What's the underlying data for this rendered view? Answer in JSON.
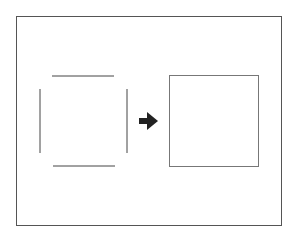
{
  "diagram": {
    "colors": {
      "background": "#ffffff",
      "frame": "#555555",
      "segments": "#444444",
      "arrow": "#222222",
      "square": "#777777"
    },
    "frame": {
      "x": 16,
      "y": 16,
      "width": 265,
      "height": 209
    },
    "open_square": {
      "top": {
        "x1": 52,
        "y1": 76,
        "x2": 114,
        "y2": 76
      },
      "bottom": {
        "x1": 53,
        "y1": 166,
        "x2": 115,
        "y2": 166
      },
      "left": {
        "x1": 40,
        "y1": 89,
        "x2": 40,
        "y2": 153
      },
      "right": {
        "x1": 127,
        "y1": 89,
        "x2": 127,
        "y2": 153
      }
    },
    "arrow": {
      "direction": "right",
      "x": 139,
      "y": 112,
      "width": 19,
      "height": 18
    },
    "closed_square": {
      "x": 169,
      "y": 75,
      "width": 89,
      "height": 91
    }
  }
}
